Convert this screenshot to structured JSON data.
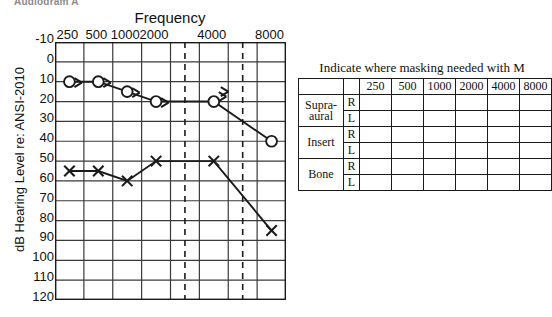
{
  "figure": {
    "title": "Audiogram A"
  },
  "chart_data": {
    "type": "line",
    "title": "Frequency",
    "xlabel": "Frequency",
    "ylabel": "dB Hearing Level re: ANSI-2010",
    "x_tick_labels": [
      "250",
      "500",
      "1000",
      "2000",
      "4000",
      "8000"
    ],
    "x_frequencies": [
      250,
      500,
      1000,
      2000,
      4000,
      8000
    ],
    "interoctave_dashed_frequencies": [
      3000,
      6000
    ],
    "y_tick_labels": [
      "-10",
      "0",
      "10",
      "20",
      "30",
      "40",
      "50",
      "60",
      "70",
      "80",
      "90",
      "100",
      "110",
      "120"
    ],
    "ylim": [
      -10,
      120
    ],
    "y_inverted": true,
    "grid": true,
    "series": [
      {
        "name": "Right ear air conduction (unmasked)",
        "symbol": "circle",
        "marker_name": "circle-symbol-right-air",
        "categories": [
          250,
          500,
          1000,
          2000,
          4000,
          8000
        ],
        "values": [
          10,
          10,
          15,
          20,
          20,
          40
        ],
        "annotations": "arrow markers (no response / masking arrows) at 250, 500, 1000, 2000, 4000"
      },
      {
        "name": "Left ear air conduction (unmasked)",
        "symbol": "x",
        "marker_name": "x-symbol-left-air",
        "categories": [
          250,
          500,
          1000,
          2000,
          4000,
          8000
        ],
        "values": [
          55,
          55,
          60,
          50,
          50,
          85
        ]
      }
    ],
    "arrow_markers": [
      {
        "freq": 250,
        "value": 10
      },
      {
        "freq": 500,
        "value": 10
      },
      {
        "freq": 1000,
        "value": 15
      },
      {
        "freq": 2000,
        "value": 20
      },
      {
        "freq": 4000,
        "value": 17
      }
    ]
  },
  "masking_table": {
    "caption": "Indicate where masking needed with M",
    "corner_blank_1": "",
    "corner_blank_2": "",
    "frequency_headers": [
      "250",
      "500",
      "1000",
      "2000",
      "4000",
      "8000"
    ],
    "rows": [
      {
        "device": "Supra-\naural",
        "device_line1": "Supra-",
        "device_line2": "aural",
        "ear": "R",
        "cells": [
          "",
          "",
          "",
          "",
          "",
          ""
        ]
      },
      {
        "device": "Supra-aural",
        "ear": "L",
        "cells": [
          "",
          "",
          "",
          "",
          "",
          ""
        ]
      },
      {
        "device": "Insert",
        "ear": "R",
        "cells": [
          "",
          "",
          "",
          "",
          "",
          ""
        ]
      },
      {
        "device": "Insert",
        "ear": "L",
        "cells": [
          "",
          "",
          "",
          "",
          "",
          ""
        ]
      },
      {
        "device": "Bone",
        "ear": "R",
        "cells": [
          "",
          "",
          "",
          "",
          "",
          ""
        ]
      },
      {
        "device": "Bone",
        "ear": "L",
        "cells": [
          "",
          "",
          "",
          "",
          "",
          ""
        ]
      }
    ],
    "device_labels": {
      "supraaural_line1": "Supra-",
      "supraaural_line2": "aural",
      "insert": "Insert",
      "bone": "Bone"
    },
    "ear_labels": {
      "right": "R",
      "left": "L"
    }
  },
  "colors": {
    "ink": "#1b1b1b",
    "grid": "#3a3a3a",
    "background": "#ffffff"
  }
}
